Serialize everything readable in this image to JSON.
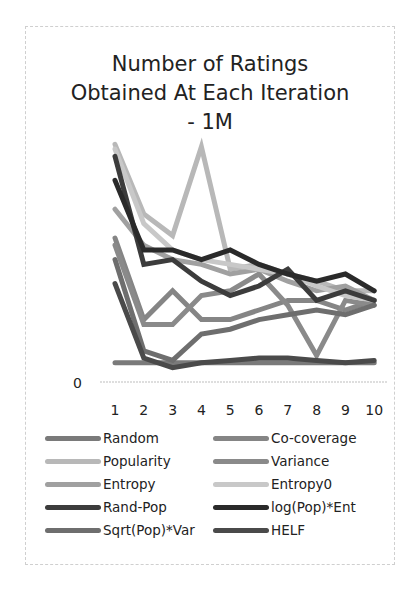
{
  "chart_data": {
    "type": "line",
    "title": "Number of Ratings Obtained At Each Iteration - 1M",
    "title_lines": [
      "Number of Ratings",
      "Obtained At Each Iteration",
      "- 1M"
    ],
    "xlabel": "",
    "ylabel": "",
    "x": [
      1,
      2,
      3,
      4,
      5,
      6,
      7,
      8,
      9,
      10
    ],
    "x_tick_labels": [
      "1",
      "2",
      "3",
      "4",
      "5",
      "6",
      "7",
      "8",
      "9",
      "10"
    ],
    "y_tick_labels": [
      "0"
    ],
    "ylim": [
      0,
      100
    ],
    "grid": false,
    "legend_position": "bottom",
    "series": [
      {
        "name": "Random",
        "color": "#7a7a7a",
        "values": [
          8,
          8,
          8,
          8,
          8,
          8,
          8,
          8,
          8,
          8
        ]
      },
      {
        "name": "Co-coverage",
        "color": "#858585",
        "values": [
          60,
          26,
          38,
          26,
          26,
          30,
          34,
          34,
          30,
          34
        ]
      },
      {
        "name": "Popularity",
        "color": "#b8b8b8",
        "values": [
          99,
          70,
          61,
          98,
          47,
          49,
          45,
          42,
          38,
          38
        ]
      },
      {
        "name": "Variance",
        "color": "#8a8a8a",
        "values": [
          57,
          24,
          24,
          36,
          38,
          45,
          32,
          11,
          34,
          32
        ]
      },
      {
        "name": "Entropy",
        "color": "#a0a0a0",
        "values": [
          72,
          57,
          51,
          49,
          45,
          47,
          42,
          38,
          40,
          34
        ]
      },
      {
        "name": "Entropy0",
        "color": "#c8c8c8",
        "values": [
          97,
          66,
          55,
          51,
          49,
          47,
          45,
          40,
          36,
          34
        ]
      },
      {
        "name": "Rand-Pop",
        "color": "#3c3c3c",
        "values": [
          94,
          49,
          51,
          42,
          36,
          40,
          47,
          34,
          38,
          34
        ]
      },
      {
        "name": "log(Pop)*Ent",
        "color": "#2a2a2a",
        "values": [
          84,
          55,
          55,
          51,
          55,
          49,
          45,
          42,
          45,
          38
        ]
      },
      {
        "name": "Sqrt(Pop)*Var",
        "color": "#6e6e6e",
        "values": [
          51,
          13,
          9,
          20,
          22,
          26,
          28,
          30,
          28,
          32
        ]
      },
      {
        "name": "HELF",
        "color": "#4a4a4a",
        "values": [
          41,
          10,
          6,
          8,
          9,
          10,
          10,
          9,
          8,
          9
        ]
      }
    ]
  },
  "legend": {
    "items": [
      {
        "label": "Random",
        "color": "#7a7a7a"
      },
      {
        "label": "Co-coverage",
        "color": "#858585"
      },
      {
        "label": "Popularity",
        "color": "#b8b8b8"
      },
      {
        "label": "Variance",
        "color": "#8a8a8a"
      },
      {
        "label": "Entropy",
        "color": "#a0a0a0"
      },
      {
        "label": "Entropy0",
        "color": "#c8c8c8"
      },
      {
        "label": "Rand-Pop",
        "color": "#3c3c3c"
      },
      {
        "label": "log(Pop)*Ent",
        "color": "#2a2a2a"
      },
      {
        "label": "Sqrt(Pop)*Var",
        "color": "#6e6e6e"
      },
      {
        "label": "HELF",
        "color": "#4a4a4a"
      }
    ]
  }
}
